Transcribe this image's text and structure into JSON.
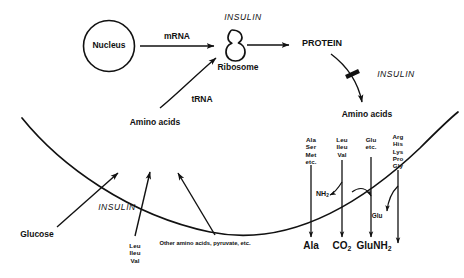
{
  "diagram": {
    "nucleus_label": "Nucleus",
    "mrna_label": "mRNA",
    "insulin_ribosome_label": "INSULIN",
    "ribosome_label": "Ribosome",
    "protein_label": "PROTEIN",
    "insulin_protein_label": "INSULIN",
    "amino_acids_right_label": "Amino acids",
    "trna_label": "tRNA",
    "amino_acids_center_label": "Amino acids",
    "insulin_membrane_label": "INSULIN",
    "glucose_label": "Glucose",
    "leu_ileu_val_label": "Leu\nIleu\nVal",
    "other_substrates_label": "Other amino acids, pyruvate, etc.",
    "nh2_label": "NH",
    "nh2_sub": "2",
    "glu_transfer_label": "Glu"
  },
  "columns": [
    {
      "id": "col-ala",
      "inputs": [
        "Ala",
        "Ser",
        "Met",
        "etc."
      ],
      "product": "Ala",
      "product_sub": ""
    },
    {
      "id": "col-leu",
      "inputs": [
        "Leu",
        "Ileu",
        "Val"
      ],
      "product": "CO",
      "product_sub": "2"
    },
    {
      "id": "col-glu",
      "inputs": [
        "Glu",
        "etc."
      ],
      "product": "GluNH",
      "product_sub": "2"
    },
    {
      "id": "col-arg",
      "inputs": [
        "Arg",
        "His",
        "Lys",
        "Pro",
        "Gly"
      ],
      "product": "",
      "product_sub": ""
    }
  ],
  "colors": {
    "ink": "#111111",
    "background": "#ffffff"
  }
}
